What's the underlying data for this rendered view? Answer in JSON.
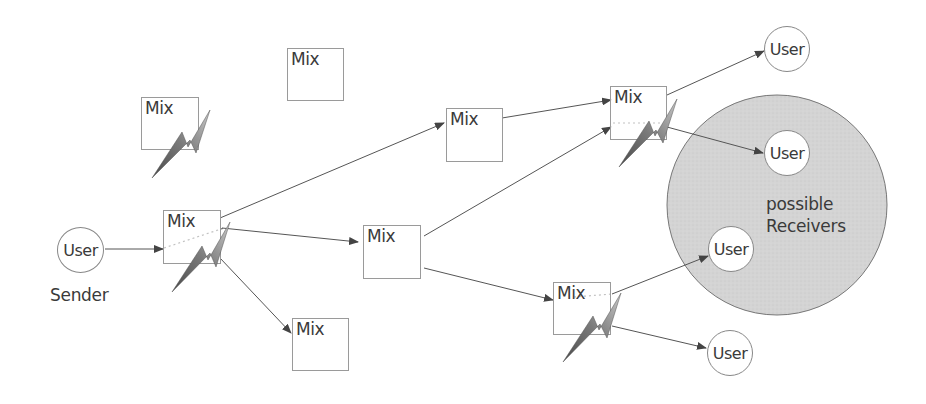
{
  "diagram": {
    "type": "mix-network",
    "colors": {
      "background": "#ffffff",
      "node_border": "#9a9a9a",
      "edge": "#555555",
      "receivers_fill": "#d2d2d2",
      "text": "#3a3a3a",
      "lightning_dark": "#555555",
      "lightning_light": "#b0b0b0"
    },
    "sender": {
      "label": "User",
      "caption": "Sender"
    },
    "mixes": [
      {
        "id": "mix-top-center",
        "label": "Mix",
        "compromised": false
      },
      {
        "id": "mix-upper-left",
        "label": "Mix",
        "compromised": true
      },
      {
        "id": "mix-first-hop",
        "label": "Mix",
        "compromised": true
      },
      {
        "id": "mix-bottom-left",
        "label": "Mix",
        "compromised": false
      },
      {
        "id": "mix-middle-upper",
        "label": "Mix",
        "compromised": false
      },
      {
        "id": "mix-middle",
        "label": "Mix",
        "compromised": false
      },
      {
        "id": "mix-upper-right",
        "label": "Mix",
        "compromised": true
      },
      {
        "id": "mix-lower-right",
        "label": "Mix",
        "compromised": true
      }
    ],
    "receivers": [
      {
        "id": "user-top",
        "label": "User"
      },
      {
        "id": "user-upper",
        "label": "User"
      },
      {
        "id": "user-lower",
        "label": "User"
      },
      {
        "id": "user-bottom",
        "label": "User"
      }
    ],
    "possible_receivers_label": [
      "possible",
      "Receivers"
    ]
  }
}
